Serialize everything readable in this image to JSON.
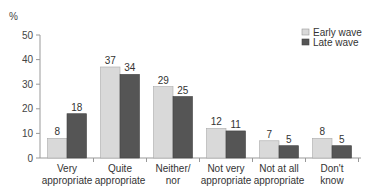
{
  "chart_data": {
    "type": "bar",
    "title": "",
    "xlabel": "",
    "ylabel": "%",
    "ylim": [
      0,
      50
    ],
    "yticks": [
      0,
      10,
      20,
      30,
      40,
      50
    ],
    "grid": false,
    "legend_position": "top-right",
    "categories": [
      [
        "Very",
        "appropriate"
      ],
      [
        "Quite",
        "appropriate"
      ],
      [
        "Neither/",
        "nor"
      ],
      [
        "Not very",
        "appropriate"
      ],
      [
        "Not at all",
        "appropriate"
      ],
      [
        "Don't",
        "know"
      ]
    ],
    "series": [
      {
        "name": "Early wave",
        "color": "#d9d9d9",
        "values": [
          8,
          37,
          29,
          12,
          7,
          8
        ]
      },
      {
        "name": "Late wave",
        "color": "#555555",
        "values": [
          18,
          34,
          25,
          11,
          5,
          5
        ]
      }
    ]
  }
}
